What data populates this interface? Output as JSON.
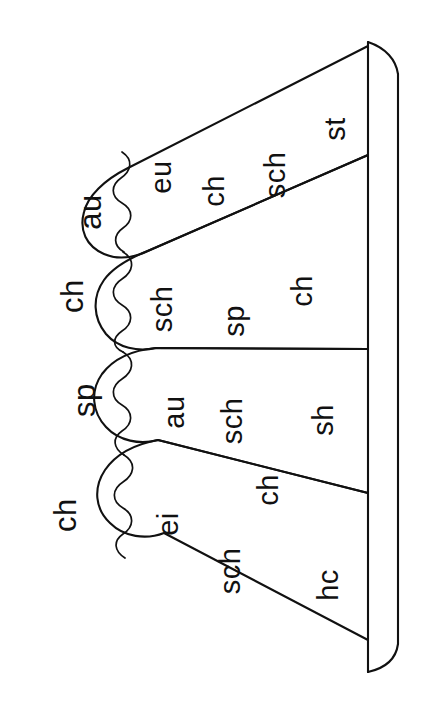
{
  "figure": {
    "kind": "line-drawing",
    "background_color": "#ffffff",
    "stroke_color": "#111111",
    "text_color": "#111111",
    "text_rotation_degrees": -90,
    "width": 431,
    "height": 727
  },
  "spine": {
    "name": "vertical-bar",
    "label": ""
  },
  "fingers": [
    {
      "index": 1,
      "tip_label": "au",
      "body_labels": [
        "eu",
        "ch",
        "sch",
        "st"
      ]
    },
    {
      "index": 2,
      "tip_label": "ch",
      "body_labels": [
        "sch",
        "sp",
        "ch"
      ]
    },
    {
      "index": 3,
      "tip_label": "sp",
      "body_labels": [
        "au",
        "sch",
        "sh"
      ]
    },
    {
      "index": 4,
      "tip_label": "ch",
      "body_labels": [
        "ei",
        "sch",
        "ch",
        "hc"
      ]
    }
  ],
  "labels": {
    "f1_tip": "au",
    "f1_a": "eu",
    "f1_b": "ch",
    "f1_c": "sch",
    "f1_d": "st",
    "f2_tip": "ch",
    "f2_a": "sch",
    "f2_b": "sp",
    "f2_c": "ch",
    "f3_tip": "sp",
    "f3_a": "au",
    "f3_b": "sch",
    "f3_c": "sh",
    "f4_tip": "ch",
    "f4_a": "ei",
    "f4_b": "sch",
    "f4_c": "ch",
    "f4_d": "hc"
  }
}
